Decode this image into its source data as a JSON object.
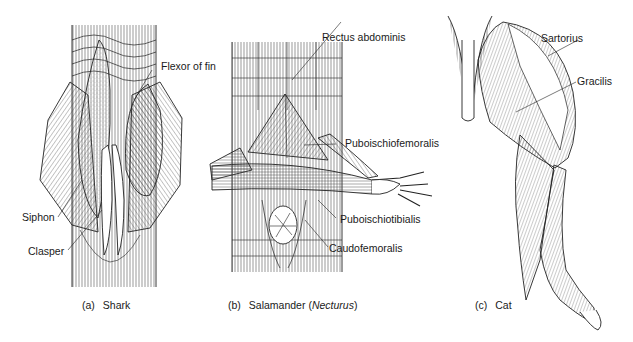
{
  "panels": [
    {
      "id": "a",
      "caption_letter": "(a)",
      "caption_name": "Shark",
      "labels": [
        {
          "text": "Flexor of fin"
        },
        {
          "text": "Siphon"
        },
        {
          "text": "Clasper"
        }
      ]
    },
    {
      "id": "b",
      "caption_letter": "(b)",
      "caption_prefix": "Salamander (",
      "caption_italic": "Necturus",
      "caption_suffix": ")",
      "labels": [
        {
          "text": "Rectus abdominis"
        },
        {
          "text": "Puboischiofemoralis"
        },
        {
          "text": "Puboischiotibialis"
        },
        {
          "text": "Caudofemoralis"
        }
      ]
    },
    {
      "id": "c",
      "caption_letter": "(c)",
      "caption_name": "Cat",
      "labels": [
        {
          "text": "Sartorius"
        },
        {
          "text": "Gracilis"
        }
      ]
    }
  ],
  "colors": {
    "line": "#222222",
    "background": "#ffffff",
    "stipple": "#9a9a9a"
  }
}
